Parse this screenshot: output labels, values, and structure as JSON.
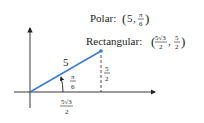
{
  "diagram": {
    "type": "polar-to-rectangular",
    "colors": {
      "axis": "#231f20",
      "vector": "#3b7bd4",
      "dashed": "#231f20",
      "text": "#231f20"
    },
    "labels": {
      "polar_prefix": "Polar: ",
      "polar_r": "5",
      "polar_theta_num": "π",
      "polar_theta_den": "6",
      "rect_prefix": "Rectangular: ",
      "rect_x_num": "5√3",
      "rect_x_den": "2",
      "rect_y_num": "5",
      "rect_y_den": "2",
      "radius": "5",
      "angle_num": "π",
      "angle_den": "6",
      "x_leg_num": "5√3",
      "x_leg_den": "2",
      "y_leg_num": "5",
      "y_leg_den": "2"
    }
  }
}
